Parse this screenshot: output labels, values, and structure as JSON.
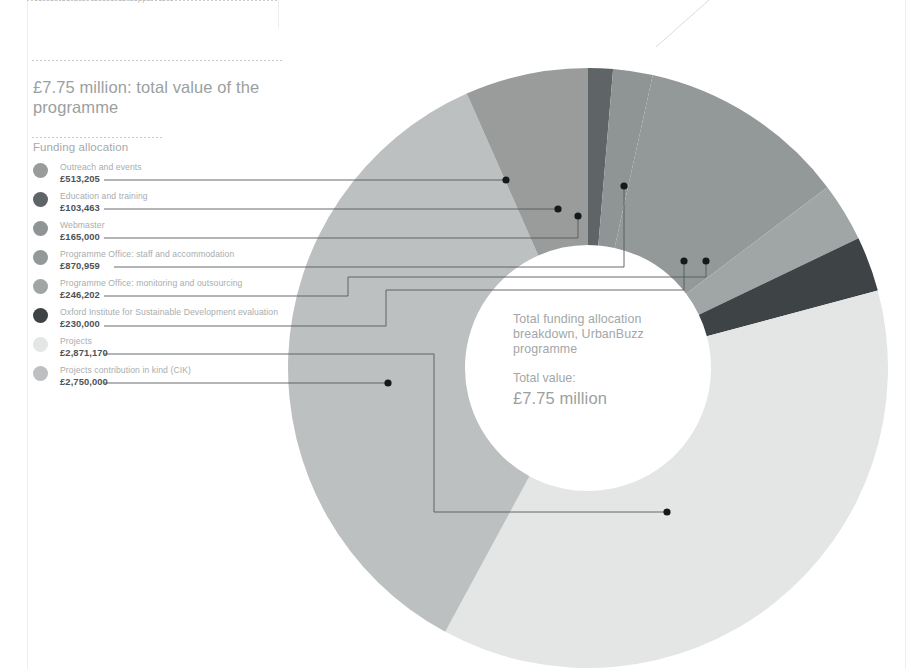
{
  "header": {
    "clipped_top_text": "combined with functional support and",
    "headline": "£7.75 million: total value of the programme"
  },
  "legend": {
    "title": "Funding allocation",
    "items": [
      {
        "label": "Outreach and events",
        "value": "£513,205",
        "color": "#9a9c9c",
        "amount": 513205
      },
      {
        "label": "Education and training",
        "value": "£103,463",
        "color": "#5f6567",
        "amount": 103463
      },
      {
        "label": "Webmaster",
        "value": "£165,000",
        "color": "#8f9495",
        "amount": 165000
      },
      {
        "label": "Programme Office: staff and accommodation",
        "value": "£870,959",
        "color": "#939899",
        "amount": 870959
      },
      {
        "label": "Programme Office:  monitoring and outsourcing",
        "value": "£246,202",
        "color": "#a0a5a6",
        "amount": 246202
      },
      {
        "label": "Oxford Institute for Sustainable Development evaluation",
        "value": "£230,000",
        "color": "#3e4446",
        "amount": 230000
      },
      {
        "label": "Projects",
        "value": "£2,871,170",
        "color": "#e4e6e6",
        "amount": 2871170
      },
      {
        "label": "Projects contribution in kind (CIK)",
        "value": "£2,750,000",
        "color": "#bdc0c0",
        "amount": 2750000
      }
    ]
  },
  "center": {
    "title": "Total funding allocation breakdown, UrbanBuzz programme",
    "total_label": "Total value:",
    "total_value": "£7.75 million"
  },
  "chart_data": {
    "type": "pie",
    "variant": "donut",
    "title": "Total funding allocation breakdown, UrbanBuzz programme",
    "total": 7749999,
    "total_display": "£7.75 million",
    "currency": "GBP",
    "units": "pounds",
    "start_angle_deg": 0,
    "direction": "clockwise",
    "center_px": [
      588,
      368
    ],
    "outer_radius_px": 300,
    "inner_radius_px": 123,
    "legend_position": "left",
    "categories": [
      "Outreach and events",
      "Education and training",
      "Webmaster",
      "Programme Office: staff and accommodation",
      "Programme Office:  monitoring and outsourcing",
      "Oxford Institute for Sustainable Development evaluation",
      "Projects",
      "Projects contribution in kind (CIK)"
    ],
    "values": [
      513205,
      103463,
      165000,
      870959,
      246202,
      230000,
      2871170,
      2750000
    ],
    "value_labels": [
      "£513,205",
      "£103,463",
      "£165,000",
      "£870,959",
      "£246,202",
      "£230,000",
      "£2,871,170",
      "£2,750,000"
    ],
    "percentages": [
      6.6,
      1.3,
      2.1,
      11.2,
      3.2,
      3.0,
      37.0,
      35.5
    ],
    "colors": [
      "#9a9c9c",
      "#5f6567",
      "#8f9495",
      "#939899",
      "#a0a5a6",
      "#3e4446",
      "#e4e6e6",
      "#bdc0c0"
    ],
    "slice_order_clockwise_from_top": [
      "Education and training",
      "Webmaster",
      "Programme Office: staff and accommodation",
      "Programme Office:  monitoring and outsourcing",
      "Oxford Institute for Sustainable Development evaluation",
      "Projects",
      "Projects contribution in kind (CIK)",
      "Outreach and events"
    ]
  }
}
